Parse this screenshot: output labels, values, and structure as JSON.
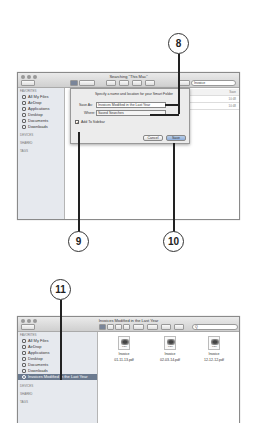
{
  "callouts": {
    "c8": "8",
    "c9": "9",
    "c10": "10",
    "c11": "11"
  },
  "window1": {
    "title": "Searching \"This Mac\"",
    "search_value": "Invoice",
    "sidebar": {
      "favorites_header": "FAVORITES",
      "items": [
        {
          "label": "All My Files",
          "icon": "all-files-icon"
        },
        {
          "label": "AirDrop",
          "icon": "airdrop-icon"
        },
        {
          "label": "Applications",
          "icon": "applications-icon"
        },
        {
          "label": "Desktop",
          "icon": "desktop-icon"
        },
        {
          "label": "Documents",
          "icon": "documents-icon"
        },
        {
          "label": "Downloads",
          "icon": "downloads-icon"
        }
      ],
      "devices_header": "DEVICES",
      "shared_header": "SHARED",
      "tags_header": "TAGS"
    },
    "columns": {
      "save_button": "Save",
      "rows": [
        "10:48",
        "10:48"
      ]
    },
    "sheet": {
      "prompt": "Specify a name and location for your Smart Folder",
      "save_as_label": "Save As:",
      "save_as_value": "Invoices Modified in the Last Year",
      "where_label": "Where:",
      "where_value": "Saved Searches",
      "add_to_sidebar_label": "Add To Sidebar",
      "add_to_sidebar_checked": true,
      "cancel_label": "Cancel",
      "save_label": "Save"
    }
  },
  "window2": {
    "title": "Invoices Modified in the Last Year",
    "search_placeholder": "Q",
    "sidebar": {
      "favorites_header": "FAVORITES",
      "items": [
        {
          "label": "All My Files",
          "icon": "all-files-icon"
        },
        {
          "label": "AirDrop",
          "icon": "airdrop-icon"
        },
        {
          "label": "Applications",
          "icon": "applications-icon"
        },
        {
          "label": "Desktop",
          "icon": "desktop-icon"
        },
        {
          "label": "Documents",
          "icon": "documents-icon"
        },
        {
          "label": "Downloads",
          "icon": "downloads-icon"
        },
        {
          "label": "Invoices Modified in the Last Year",
          "icon": "smart-folder-icon",
          "selected": true
        }
      ],
      "devices_header": "DEVICES",
      "shared_header": "SHARED",
      "tags_header": "TAGS"
    },
    "files": [
      {
        "type": "PDF",
        "line1": "Invoice",
        "line2": "01-11-13.pdf"
      },
      {
        "type": "PDF",
        "line1": "Invoice",
        "line2": "02-03-14.pdf"
      },
      {
        "type": "PDF",
        "line1": "Invoice",
        "line2": "12-12-12.pdf"
      }
    ]
  }
}
